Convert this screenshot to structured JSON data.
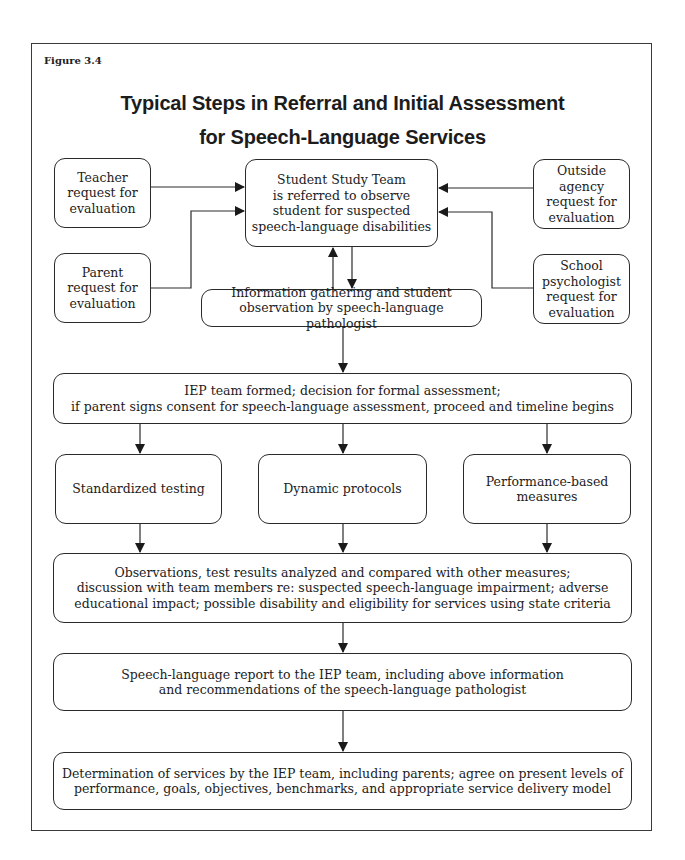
{
  "figure_label": "Figure 3.4",
  "title": {
    "line1": "Typical Steps in Referral and Initial Assessment",
    "line2": "for Speech-Language Services"
  },
  "nodes": {
    "teacher": "Teacher\nrequest for\nevaluation",
    "parent": "Parent\nrequest for\nevaluation",
    "outside_agency": "Outside agency\nrequest for\nevaluation",
    "school_psychologist": "School\npsychologist\nrequest for\nevaluation",
    "student_study_team": "Student Study Team\nis referred to observe\nstudent for suspected\nspeech-language disabilities",
    "information_gathering": "Information gathering and student\nobservation by speech-language pathologist",
    "iep_team_formed": "IEP team formed; decision for formal assessment;\nif parent signs consent for speech-language assessment, proceed and timeline begins",
    "standardized_testing": "Standardized testing",
    "dynamic_protocols": "Dynamic protocols",
    "performance_measures": "Performance-based\nmeasures",
    "observations": "Observations, test results analyzed and compared with other measures;\ndiscussion with team members re: suspected speech-language impairment; adverse\neducational impact; possible disability and eligibility for services using state criteria",
    "report": "Speech-language report to the IEP team, including above information\nand recommendations of the speech-language pathologist",
    "determination": "Determination of services by the IEP team, including parents; agree on present levels of\nperformance, goals, objectives, benchmarks, and appropriate service delivery model"
  },
  "edges": [
    {
      "from": "teacher",
      "to": "student_study_team"
    },
    {
      "from": "parent",
      "to": "student_study_team"
    },
    {
      "from": "outside_agency",
      "to": "student_study_team"
    },
    {
      "from": "school_psychologist",
      "to": "student_study_team"
    },
    {
      "from": "student_study_team",
      "to": "information_gathering"
    },
    {
      "from": "information_gathering",
      "to": "student_study_team"
    },
    {
      "from": "information_gathering",
      "to": "iep_team_formed"
    },
    {
      "from": "iep_team_formed",
      "to": "standardized_testing"
    },
    {
      "from": "iep_team_formed",
      "to": "dynamic_protocols"
    },
    {
      "from": "iep_team_formed",
      "to": "performance_measures"
    },
    {
      "from": "standardized_testing",
      "to": "observations"
    },
    {
      "from": "dynamic_protocols",
      "to": "observations"
    },
    {
      "from": "performance_measures",
      "to": "observations"
    },
    {
      "from": "observations",
      "to": "report"
    },
    {
      "from": "report",
      "to": "determination"
    }
  ]
}
